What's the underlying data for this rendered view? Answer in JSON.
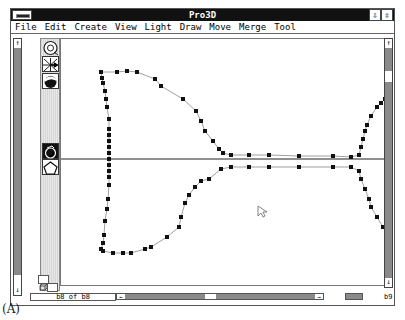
{
  "window": {
    "title": "Pro3D",
    "controls": {
      "minimize_glyph": "⇩",
      "restore_glyph": "⇳"
    }
  },
  "menubar": {
    "items": [
      {
        "label": "File"
      },
      {
        "label": "Edit"
      },
      {
        "label": "Create"
      },
      {
        "label": "View"
      },
      {
        "label": "Light"
      },
      {
        "label": "Draw"
      },
      {
        "label": "Move"
      },
      {
        "label": "Merge"
      },
      {
        "label": "Tool"
      }
    ]
  },
  "toolbar": {
    "tools": [
      {
        "name": "rotate-tool",
        "icon": "rotate-icon"
      },
      {
        "name": "move-axis-tool",
        "icon": "axis-cross-icon"
      },
      {
        "name": "shading-tool",
        "icon": "shaded-sphere-icon"
      },
      {
        "name": "lathe-tool",
        "icon": "lathe-icon",
        "selected": true
      },
      {
        "name": "polygon-tool",
        "icon": "pentagon-icon"
      }
    ],
    "bottom_icons": [
      "view-cube-icon",
      "solid-cube-icon"
    ]
  },
  "scrollbars": {
    "up_arrow": "↑",
    "down_arrow": "↓",
    "left_arrow": "←",
    "right_arrow": "→"
  },
  "status": {
    "page_indicator": "b8 of b8",
    "right_indicator": "b9"
  },
  "canvas": {
    "axis_y": 120,
    "profile_upper": [
      [
        40,
        33
      ],
      [
        56,
        33
      ],
      [
        66,
        32
      ],
      [
        76,
        33
      ],
      [
        94,
        40
      ],
      [
        100,
        47
      ],
      [
        122,
        60
      ],
      [
        135,
        72
      ],
      [
        140,
        82
      ],
      [
        144,
        92
      ],
      [
        152,
        102
      ],
      [
        158,
        110
      ],
      [
        162,
        114
      ],
      [
        170,
        116
      ],
      [
        188,
        116
      ],
      [
        208,
        116
      ],
      [
        238,
        117
      ],
      [
        272,
        117
      ],
      [
        290,
        118
      ],
      [
        298,
        116
      ],
      [
        300,
        108
      ],
      [
        302,
        100
      ],
      [
        304,
        92
      ],
      [
        306,
        86
      ],
      [
        310,
        77
      ],
      [
        316,
        68
      ],
      [
        320,
        64
      ],
      [
        324,
        60
      ],
      [
        326,
        62
      ],
      [
        327,
        70
      ],
      [
        328,
        78
      ],
      [
        328,
        84
      ],
      [
        328,
        92
      ],
      [
        328,
        120
      ]
    ],
    "profile_upper_left": [
      [
        40,
        33
      ],
      [
        41,
        39
      ],
      [
        42,
        44
      ],
      [
        44,
        52
      ],
      [
        45,
        60
      ],
      [
        46,
        68
      ],
      [
        48,
        80
      ],
      [
        48,
        90
      ],
      [
        48,
        96
      ],
      [
        48,
        102
      ],
      [
        48,
        108
      ],
      [
        48,
        114
      ],
      [
        48,
        120
      ]
    ],
    "profile_lower": [
      [
        48,
        120
      ],
      [
        48,
        126
      ],
      [
        48,
        132
      ],
      [
        48,
        138
      ],
      [
        48,
        146
      ],
      [
        47,
        160
      ],
      [
        46,
        170
      ],
      [
        44,
        182
      ],
      [
        43,
        196
      ],
      [
        42,
        204
      ],
      [
        40,
        210
      ],
      [
        42,
        212
      ],
      [
        52,
        214
      ],
      [
        62,
        214
      ],
      [
        70,
        214
      ],
      [
        84,
        210
      ],
      [
        90,
        208
      ],
      [
        106,
        198
      ],
      [
        118,
        188
      ],
      [
        120,
        178
      ],
      [
        124,
        164
      ],
      [
        128,
        156
      ],
      [
        134,
        148
      ],
      [
        140,
        142
      ],
      [
        148,
        140
      ],
      [
        160,
        130
      ],
      [
        170,
        128
      ],
      [
        188,
        128
      ],
      [
        208,
        128
      ],
      [
        238,
        128
      ],
      [
        272,
        128
      ],
      [
        290,
        128
      ],
      [
        298,
        132
      ],
      [
        300,
        140
      ],
      [
        304,
        150
      ],
      [
        308,
        160
      ],
      [
        310,
        168
      ],
      [
        316,
        178
      ],
      [
        322,
        188
      ],
      [
        326,
        192
      ],
      [
        328,
        186
      ],
      [
        328,
        176
      ],
      [
        328,
        166
      ],
      [
        328,
        156
      ],
      [
        328,
        140
      ],
      [
        328,
        120
      ]
    ]
  },
  "caption": "(A)"
}
